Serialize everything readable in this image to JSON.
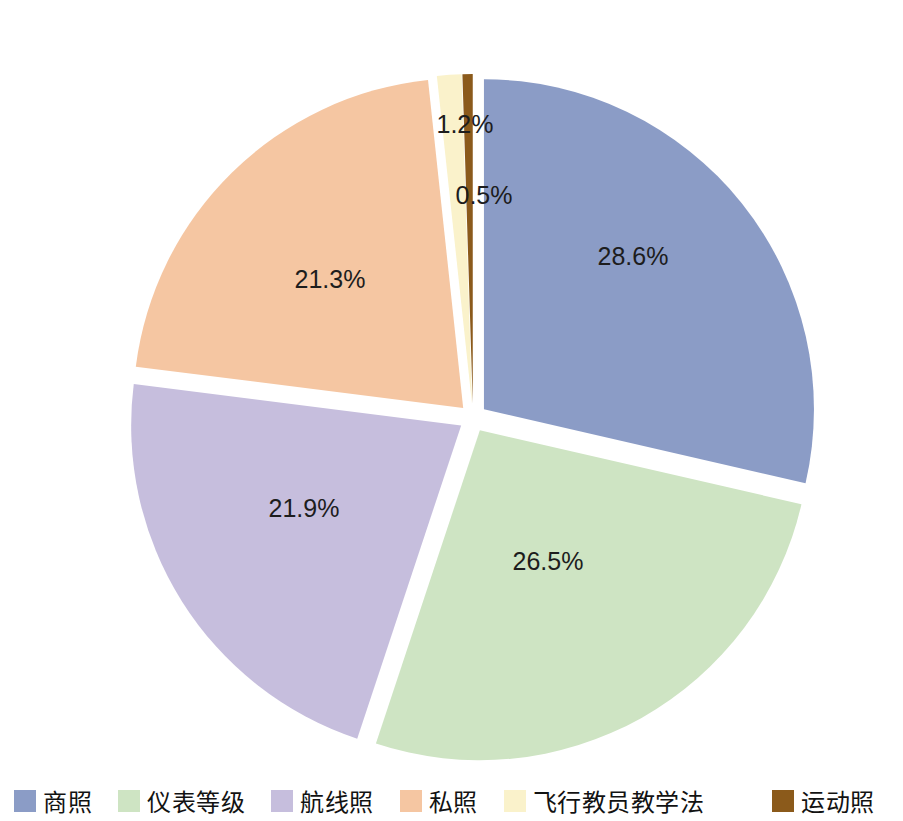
{
  "chart_data": {
    "type": "pie",
    "title": "",
    "subtitle": "",
    "xlabel": "",
    "ylabel": "",
    "legend_position": "bottom",
    "grid": false,
    "value_unit": "%",
    "categories": [
      "商照",
      "仪表等级",
      "航线照",
      "私照",
      "飞行教员教学法",
      "运动照"
    ],
    "values": [
      28.6,
      26.5,
      21.9,
      21.3,
      1.2,
      0.5
    ],
    "labels": [
      "28.6%",
      "26.5%",
      "21.9%",
      "21.3%",
      "1.2%",
      "0.5%"
    ],
    "colors": [
      "#8b9cc6",
      "#cee4c3",
      "#c6bedd",
      "#f5c6a2",
      "#faf2cb",
      "#8b5a1b"
    ],
    "slices": [
      {
        "name": "商照",
        "value": 28.6,
        "label": "28.6%",
        "color": "#8b9cc6",
        "exploded": true,
        "start_angle": 0.0,
        "end_angle": 102.96,
        "label_x": 633,
        "label_y": 258
      },
      {
        "name": "仪表等级",
        "value": 26.5,
        "label": "26.5%",
        "color": "#cee4c3",
        "exploded": true,
        "start_angle": 102.96,
        "end_angle": 198.36,
        "label_x": 548,
        "label_y": 563
      },
      {
        "name": "航线照",
        "value": 21.9,
        "label": "21.9%",
        "color": "#c6bedd",
        "exploded": true,
        "start_angle": 198.36,
        "end_angle": 277.2,
        "label_x": 304,
        "label_y": 510
      },
      {
        "name": "私照",
        "value": 21.3,
        "label": "21.3%",
        "color": "#f5c6a2",
        "exploded": true,
        "start_angle": 277.2,
        "end_angle": 353.88,
        "label_x": 330,
        "label_y": 281
      },
      {
        "name": "飞行教员教学法",
        "value": 1.2,
        "label": "1.2%",
        "color": "#faf2cb",
        "exploded": true,
        "start_angle": 353.88,
        "end_angle": 358.2,
        "label_x": 465,
        "label_y": 126
      },
      {
        "name": "运动照",
        "value": 0.5,
        "label": "0.5%",
        "color": "#8b5a1b",
        "exploded": true,
        "start_angle": 358.2,
        "end_angle": 360.0,
        "label_x": 484,
        "label_y": 197
      }
    ]
  },
  "legend": {
    "items": [
      {
        "label": "商照",
        "color": "#8b9cc6"
      },
      {
        "label": "仪表等级",
        "color": "#cee4c3"
      },
      {
        "label": "航线照",
        "color": "#c6bedd"
      },
      {
        "label": "私照",
        "color": "#f5c6a2"
      },
      {
        "label": "飞行教员教学法",
        "color": "#faf2cb"
      },
      {
        "label": "运动照",
        "color": "#8b5a1b"
      }
    ]
  }
}
